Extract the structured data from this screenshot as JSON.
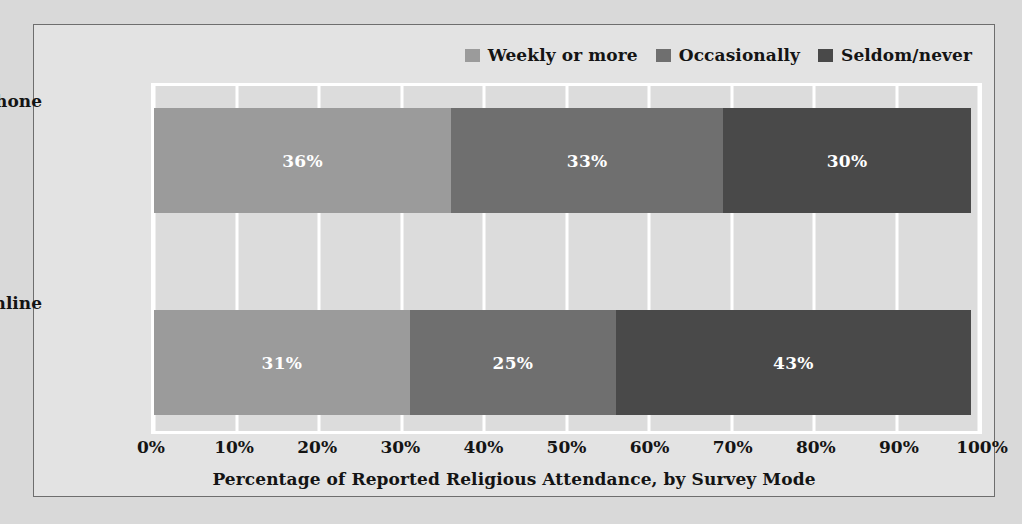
{
  "chart_data": {
    "type": "bar",
    "orientation": "horizontal",
    "stacked": true,
    "title": "",
    "xlabel": "Percentage of Reported Religious Attendance, by Survey Mode",
    "ylabel": "",
    "categories": [
      "Telephone",
      "Online"
    ],
    "xlim": [
      0,
      100
    ],
    "xticks": [
      "0%",
      "10%",
      "20%",
      "30%",
      "40%",
      "50%",
      "60%",
      "70%",
      "80%",
      "90%",
      "100%"
    ],
    "xtick_values": [
      0,
      10,
      20,
      30,
      40,
      50,
      60,
      70,
      80,
      90,
      100
    ],
    "grid": true,
    "legend_position": "top-right",
    "series": [
      {
        "name": "Weekly or more",
        "color": "#9b9b9b",
        "values": [
          36,
          31
        ],
        "labels": [
          "36%",
          "31%"
        ]
      },
      {
        "name": "Occasionally",
        "color": "#6f6f6f",
        "values": [
          33,
          25
        ],
        "labels": [
          "33%",
          "25%"
        ]
      },
      {
        "name": "Seldom/never",
        "color": "#494949",
        "values": [
          30,
          43
        ],
        "labels": [
          "30%",
          "43%"
        ]
      }
    ]
  },
  "figure": {
    "background": "#e3e3e3",
    "plot_background": "#dcdcdc",
    "border_color": "#6e6e6e",
    "grid_color": "#ffffff",
    "text_color": "#141414",
    "label_color": "#ffffff"
  }
}
